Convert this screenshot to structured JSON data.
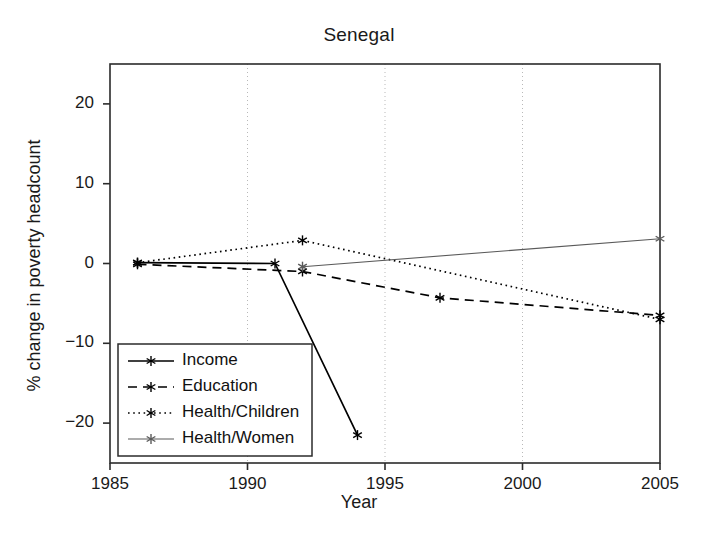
{
  "chart_data": {
    "type": "line",
    "title": "Senegal",
    "xlabel": "Year",
    "ylabel": "% change in poverty headcount",
    "xlim": [
      1985,
      2005
    ],
    "ylim": [
      -25,
      25
    ],
    "xticks": [
      1985,
      1990,
      1995,
      2000,
      2005
    ],
    "xtick_labels": [
      "1985",
      "1990",
      "1995",
      "2000",
      "2005"
    ],
    "yticks": [
      20,
      10,
      0,
      -10,
      -20
    ],
    "ytick_labels": [
      "20",
      "10",
      "0",
      "−10",
      "−20"
    ],
    "grid": "vertical-dotted",
    "legend_position": "lower left",
    "series": [
      {
        "name": "Income",
        "style": "solid",
        "color": "#000000",
        "marker": "asterisk",
        "x": [
          1986,
          1991,
          1994
        ],
        "y": [
          0.1,
          0.0,
          -21.5
        ]
      },
      {
        "name": "Education",
        "style": "dashed",
        "color": "#000000",
        "marker": "asterisk",
        "x": [
          1986,
          1992,
          1997,
          2005
        ],
        "y": [
          -0.1,
          -1.0,
          -4.3,
          -6.5
        ]
      },
      {
        "name": "Health/Children",
        "style": "dotted",
        "color": "#000000",
        "marker": "asterisk",
        "x": [
          1986,
          1992,
          2005
        ],
        "y": [
          0.1,
          2.9,
          -7.0
        ]
      },
      {
        "name": "Health/Women",
        "style": "solid-thin",
        "color": "#5a5a5a",
        "marker": "asterisk",
        "x": [
          1992,
          2005
        ],
        "y": [
          -0.4,
          3.1
        ]
      }
    ]
  },
  "axes": {
    "plot_left_px": 110,
    "plot_right_px": 660,
    "plot_top_px": 64,
    "plot_bottom_px": 463
  },
  "legend": {
    "entries": [
      {
        "label": "Income"
      },
      {
        "label": "Education"
      },
      {
        "label": "Health/Children"
      },
      {
        "label": "Health/Women"
      }
    ]
  }
}
